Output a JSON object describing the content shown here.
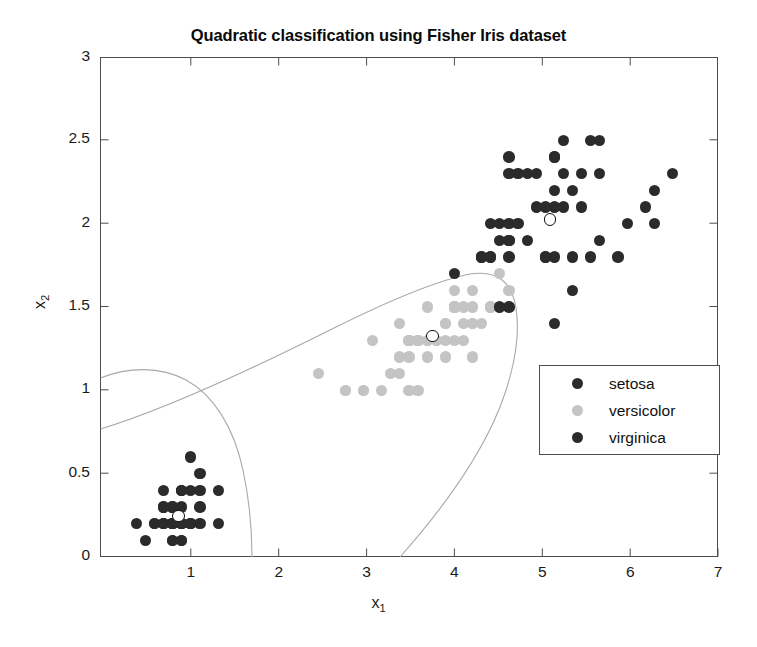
{
  "chart_data": {
    "type": "scatter",
    "title": "Quadratic classification using Fisher Iris dataset",
    "xlabel": "x_1",
    "ylabel": "x_2",
    "xlim": [
      0.6,
      7.4
    ],
    "ylim": [
      0,
      3
    ],
    "xticks": [
      1,
      2,
      3,
      4,
      5,
      6,
      7
    ],
    "yticks": [
      0,
      0.5,
      1,
      1.5,
      2,
      2.5,
      3
    ],
    "xticklabels": [
      "1",
      "2",
      "3",
      "4",
      "5",
      "6",
      "7"
    ],
    "yticklabels": [
      "0",
      "0.5",
      "1",
      "1.5",
      "2",
      "2.5",
      "3"
    ],
    "grid": false,
    "legend_position": "center-right",
    "series": [
      {
        "name": "setosa",
        "color": "#2b2b2b",
        "points": [
          [
            1.4,
            0.2
          ],
          [
            1.4,
            0.2
          ],
          [
            1.3,
            0.2
          ],
          [
            1.5,
            0.2
          ],
          [
            1.4,
            0.2
          ],
          [
            1.7,
            0.4
          ],
          [
            1.4,
            0.3
          ],
          [
            1.5,
            0.2
          ],
          [
            1.4,
            0.2
          ],
          [
            1.5,
            0.1
          ],
          [
            1.5,
            0.2
          ],
          [
            1.6,
            0.2
          ],
          [
            1.4,
            0.1
          ],
          [
            1.1,
            0.1
          ],
          [
            1.2,
            0.2
          ],
          [
            1.5,
            0.4
          ],
          [
            1.3,
            0.4
          ],
          [
            1.4,
            0.3
          ],
          [
            1.7,
            0.3
          ],
          [
            1.5,
            0.3
          ],
          [
            1.7,
            0.2
          ],
          [
            1.5,
            0.4
          ],
          [
            1.0,
            0.2
          ],
          [
            1.7,
            0.5
          ],
          [
            1.9,
            0.2
          ],
          [
            1.6,
            0.2
          ],
          [
            1.6,
            0.4
          ],
          [
            1.5,
            0.2
          ],
          [
            1.4,
            0.2
          ],
          [
            1.6,
            0.2
          ],
          [
            1.6,
            0.2
          ],
          [
            1.5,
            0.4
          ],
          [
            1.5,
            0.1
          ],
          [
            1.4,
            0.2
          ],
          [
            1.5,
            0.2
          ],
          [
            1.2,
            0.2
          ],
          [
            1.3,
            0.2
          ],
          [
            1.4,
            0.1
          ],
          [
            1.3,
            0.2
          ],
          [
            1.5,
            0.2
          ],
          [
            1.3,
            0.3
          ],
          [
            1.3,
            0.3
          ],
          [
            1.3,
            0.2
          ],
          [
            1.6,
            0.6
          ],
          [
            1.9,
            0.4
          ],
          [
            1.4,
            0.3
          ],
          [
            1.6,
            0.2
          ],
          [
            1.4,
            0.2
          ],
          [
            1.5,
            0.2
          ],
          [
            1.4,
            0.2
          ]
        ],
        "centroid": [
          1.462,
          0.246
        ]
      },
      {
        "name": "versicolor",
        "color": "#c4c4c4",
        "points": [
          [
            4.7,
            1.4
          ],
          [
            4.5,
            1.5
          ],
          [
            4.9,
            1.5
          ],
          [
            4.0,
            1.3
          ],
          [
            4.6,
            1.5
          ],
          [
            4.5,
            1.3
          ],
          [
            4.7,
            1.6
          ],
          [
            3.3,
            1.0
          ],
          [
            4.6,
            1.3
          ],
          [
            3.9,
            1.4
          ],
          [
            3.5,
            1.0
          ],
          [
            4.2,
            1.5
          ],
          [
            4.0,
            1.0
          ],
          [
            4.7,
            1.4
          ],
          [
            3.6,
            1.3
          ],
          [
            4.4,
            1.4
          ],
          [
            4.5,
            1.5
          ],
          [
            4.1,
            1.0
          ],
          [
            4.5,
            1.5
          ],
          [
            3.9,
            1.1
          ],
          [
            4.8,
            1.8
          ],
          [
            4.0,
            1.3
          ],
          [
            4.9,
            1.5
          ],
          [
            4.7,
            1.2
          ],
          [
            4.3,
            1.3
          ],
          [
            4.4,
            1.4
          ],
          [
            4.8,
            1.4
          ],
          [
            5.0,
            1.7
          ],
          [
            4.5,
            1.5
          ],
          [
            3.5,
            1.0
          ],
          [
            3.8,
            1.1
          ],
          [
            3.7,
            1.0
          ],
          [
            3.9,
            1.2
          ],
          [
            5.1,
            1.6
          ],
          [
            4.5,
            1.5
          ],
          [
            4.5,
            1.6
          ],
          [
            4.7,
            1.5
          ],
          [
            4.4,
            1.3
          ],
          [
            4.1,
            1.3
          ],
          [
            4.0,
            1.3
          ],
          [
            4.4,
            1.2
          ],
          [
            4.6,
            1.4
          ],
          [
            4.0,
            1.2
          ],
          [
            3.3,
            1.0
          ],
          [
            4.2,
            1.3
          ],
          [
            4.2,
            1.2
          ],
          [
            4.2,
            1.3
          ],
          [
            4.3,
            1.3
          ],
          [
            3.0,
            1.1
          ],
          [
            4.1,
            1.3
          ]
        ],
        "centroid": [
          4.26,
          1.326
        ]
      },
      {
        "name": "virginica",
        "color": "#2b2b2b",
        "points": [
          [
            6.0,
            2.5
          ],
          [
            5.1,
            1.9
          ],
          [
            5.9,
            2.1
          ],
          [
            5.6,
            1.8
          ],
          [
            5.8,
            2.2
          ],
          [
            6.6,
            2.1
          ],
          [
            4.5,
            1.7
          ],
          [
            6.3,
            1.8
          ],
          [
            5.8,
            1.8
          ],
          [
            6.1,
            2.5
          ],
          [
            5.1,
            2.0
          ],
          [
            5.3,
            1.9
          ],
          [
            5.5,
            2.1
          ],
          [
            5.0,
            2.0
          ],
          [
            5.1,
            2.4
          ],
          [
            5.3,
            2.3
          ],
          [
            5.5,
            1.8
          ],
          [
            6.7,
            2.2
          ],
          [
            6.9,
            2.3
          ],
          [
            5.0,
            1.5
          ],
          [
            5.7,
            2.3
          ],
          [
            4.9,
            2.0
          ],
          [
            6.7,
            2.0
          ],
          [
            4.9,
            1.8
          ],
          [
            5.7,
            2.1
          ],
          [
            6.0,
            1.8
          ],
          [
            4.8,
            1.8
          ],
          [
            4.9,
            1.8
          ],
          [
            5.6,
            2.1
          ],
          [
            5.8,
            1.6
          ],
          [
            6.1,
            1.9
          ],
          [
            6.4,
            2.0
          ],
          [
            5.6,
            2.2
          ],
          [
            5.1,
            1.5
          ],
          [
            5.6,
            1.4
          ],
          [
            6.1,
            2.3
          ],
          [
            5.6,
            2.4
          ],
          [
            5.5,
            1.8
          ],
          [
            4.8,
            1.8
          ],
          [
            5.4,
            2.1
          ],
          [
            5.6,
            2.4
          ],
          [
            5.1,
            2.3
          ],
          [
            5.1,
            1.9
          ],
          [
            5.9,
            2.3
          ],
          [
            5.7,
            2.5
          ],
          [
            5.2,
            2.3
          ],
          [
            5.0,
            1.9
          ],
          [
            5.2,
            2.0
          ],
          [
            5.4,
            2.3
          ],
          [
            5.1,
            1.8
          ]
        ],
        "centroid": [
          5.552,
          2.026
        ]
      }
    ],
    "boundaries": [
      {
        "name": "setosa-versicolor-boundary",
        "color": "#a8a8a8"
      },
      {
        "name": "versicolor-virginica-boundary",
        "color": "#a8a8a8"
      }
    ]
  },
  "legend": {
    "items": [
      {
        "label": "setosa",
        "color": "#2b2b2b"
      },
      {
        "label": "versicolor",
        "color": "#c4c4c4"
      },
      {
        "label": "virginica",
        "color": "#2b2b2b"
      }
    ]
  },
  "axis_labels": {
    "x_main": "x",
    "x_sub": "1",
    "y_main": "x",
    "y_sub": "2"
  }
}
